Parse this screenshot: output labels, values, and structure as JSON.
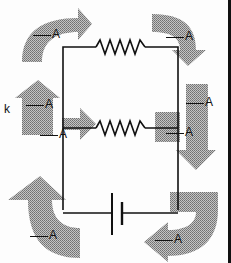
{
  "diagram": {
    "type": "circuit",
    "components": {
      "top_resistor": "resistor",
      "middle_resistor": "resistor",
      "battery": "battery"
    },
    "colors": {
      "wire": "#111111",
      "arrow_fill": "#9a9a9a",
      "background": "#fdfdfd"
    },
    "labels": {
      "unit": "A",
      "side_text": "k",
      "ammeters": [
        {
          "id": "top-left",
          "blank": "",
          "unit": "A"
        },
        {
          "id": "top-right",
          "blank": "",
          "unit": "A"
        },
        {
          "id": "mid-left-upper",
          "blank": "",
          "unit": "A"
        },
        {
          "id": "mid-left-lower",
          "blank": "",
          "unit": "A"
        },
        {
          "id": "mid-right-upper",
          "blank": "",
          "unit": "A"
        },
        {
          "id": "mid-right-lower",
          "blank": "",
          "unit": "A"
        },
        {
          "id": "bottom-left",
          "blank": "",
          "unit": "A"
        },
        {
          "id": "bottom-right",
          "blank": "",
          "unit": "A"
        }
      ]
    }
  }
}
